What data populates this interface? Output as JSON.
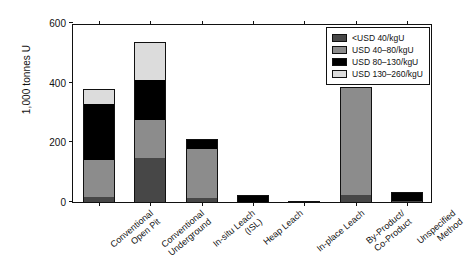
{
  "chart_data": {
    "type": "bar",
    "stacked": true,
    "title": "",
    "xlabel": "",
    "ylabel": "1,000 tonnes U",
    "ylim": [
      0,
      600
    ],
    "yticks": [
      0,
      200,
      400,
      600
    ],
    "ytick_labels": [
      "0",
      "200",
      "400",
      "600"
    ],
    "grid": false,
    "legend_position": "upper right",
    "categories": [
      "Conventional\nOpen Pit",
      "Conventional\nUnderground",
      "In-situ Leach\n(ISL)",
      "Heap Leach",
      "In-place Leach",
      "By-Product/\nCo-Product",
      "Unspecified\nMethod"
    ],
    "series": [
      {
        "name": "<USD 40/kgU",
        "color": "#474747",
        "values": [
          18,
          148,
          14,
          0,
          0,
          22,
          4
        ]
      },
      {
        "name": "USD 40–80/kgU",
        "color": "#8c8c8c",
        "values": [
          122,
          128,
          165,
          0,
          0,
          365,
          0
        ]
      },
      {
        "name": "USD 80–130/kgU",
        "color": "#000000",
        "values": [
          188,
          133,
          32,
          25,
          2,
          0,
          31
        ]
      },
      {
        "name": "USD 130–260/kgU",
        "color": "#dcdcdc",
        "values": [
          52,
          126,
          0,
          0,
          0,
          0,
          0
        ]
      }
    ],
    "totals": [
      380,
      535,
      211,
      25,
      2,
      387,
      35
    ]
  },
  "legend": {
    "items": [
      {
        "label": "<USD 40/kgU",
        "color": "#474747"
      },
      {
        "label": "USD 40–80/kgU",
        "color": "#8c8c8c"
      },
      {
        "label": "USD 80–130/kgU",
        "color": "#000000"
      },
      {
        "label": "USD 130–260/kgU",
        "color": "#dcdcdc"
      }
    ]
  },
  "axes": {
    "y_label": "1,000 tonnes U",
    "y_tick_labels": [
      "0",
      "200",
      "400",
      "600"
    ],
    "x_tick_labels": [
      "Conventional\nOpen Pit",
      "Conventional\nUnderground",
      "In-situ Leach\n(ISL)",
      "Heap Leach",
      "In-place Leach",
      "By-Product/\nCo-Product",
      "Unspecified\nMethod"
    ]
  }
}
